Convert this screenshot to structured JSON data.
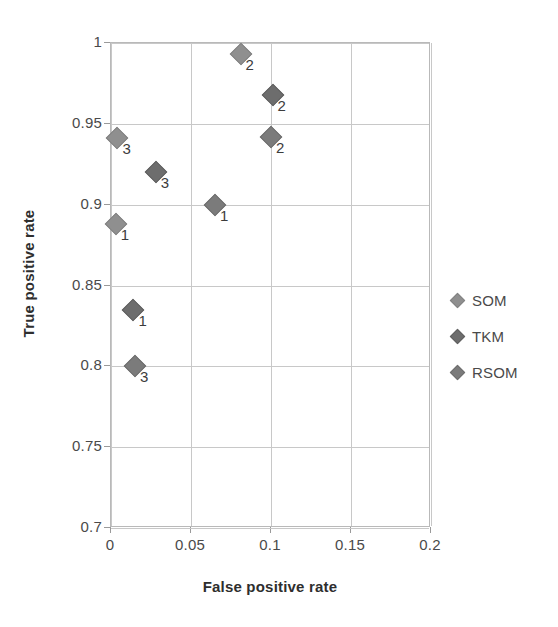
{
  "chart_data": {
    "type": "scatter",
    "title": "",
    "xlabel": "False positive rate",
    "ylabel": "True positive rate",
    "xlim": [
      0,
      0.2
    ],
    "ylim": [
      0.7,
      1
    ],
    "xticks": [
      "0",
      "0.05",
      "0.1",
      "0.15",
      "0.2"
    ],
    "xtick_values": [
      0,
      0.05,
      0.1,
      0.15,
      0.2
    ],
    "yticks": [
      "0.7",
      "0.75",
      "0.8",
      "0.85",
      "0.9",
      "0.95",
      "1"
    ],
    "ytick_values": [
      0.7,
      0.75,
      0.8,
      0.85,
      0.9,
      0.95,
      1
    ],
    "grid": true,
    "legend_position": "right",
    "series": [
      {
        "name": "SOM",
        "tone": "light",
        "points": [
          {
            "x": 0.003,
            "y": 0.888,
            "label": "1"
          },
          {
            "x": 0.081,
            "y": 0.993,
            "label": "2"
          },
          {
            "x": 0.004,
            "y": 0.941,
            "label": "3"
          }
        ]
      },
      {
        "name": "TKM",
        "tone": "dark",
        "points": [
          {
            "x": 0.014,
            "y": 0.835,
            "label": "1"
          },
          {
            "x": 0.101,
            "y": 0.968,
            "label": "2"
          },
          {
            "x": 0.028,
            "y": 0.92,
            "label": "3"
          }
        ]
      },
      {
        "name": "RSOM",
        "tone": "mid",
        "points": [
          {
            "x": 0.065,
            "y": 0.9,
            "label": "1"
          },
          {
            "x": 0.1,
            "y": 0.942,
            "label": "2"
          },
          {
            "x": 0.015,
            "y": 0.8,
            "label": "3"
          }
        ]
      }
    ],
    "legend": [
      {
        "label": "SOM",
        "tone": "light"
      },
      {
        "label": "TKM",
        "tone": "dark"
      },
      {
        "label": "RSOM",
        "tone": "mid"
      }
    ],
    "colors": {
      "marker_light": "#8f8f8f",
      "marker_mid": "#7b7b7b",
      "marker_dark": "#6d6d6d",
      "gridline": "#c8c8c8",
      "axis_border": "#b9b9b9",
      "text": "#4a4a4a",
      "background": "#ffffff"
    }
  }
}
